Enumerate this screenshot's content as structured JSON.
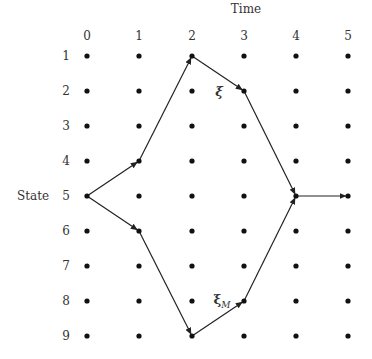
{
  "title": "Time",
  "y_axis_label": "State",
  "time_labels": [
    "0",
    "1",
    "2",
    "3",
    "4",
    "5"
  ],
  "state_labels": [
    "1",
    "2",
    "3",
    "4",
    "5",
    "6",
    "7",
    "8",
    "9"
  ],
  "grid": {
    "x": [
      87,
      139,
      192,
      244,
      296,
      348
    ],
    "y": [
      56,
      91,
      126,
      161,
      196,
      231,
      266,
      301,
      336
    ]
  },
  "paths": [
    {
      "name": "xi",
      "label": "ξ",
      "nodes": [
        [
          0,
          5
        ],
        [
          1,
          4
        ],
        [
          2,
          1
        ],
        [
          3,
          2
        ],
        [
          4,
          5
        ],
        [
          5,
          5
        ]
      ]
    },
    {
      "name": "xi-m",
      "label": "ξ_M",
      "nodes": [
        [
          0,
          5
        ],
        [
          1,
          6
        ],
        [
          2,
          9
        ],
        [
          3,
          8
        ],
        [
          4,
          5
        ]
      ]
    }
  ],
  "annotations": {
    "xi": {
      "text": "ξ",
      "x": 219,
      "y": 91
    },
    "xi_m": {
      "text": "ξ",
      "sub": "M",
      "x": 224,
      "y": 301
    }
  },
  "colors": {
    "dot": "#111111",
    "line": "#222222",
    "text": "#333333"
  }
}
